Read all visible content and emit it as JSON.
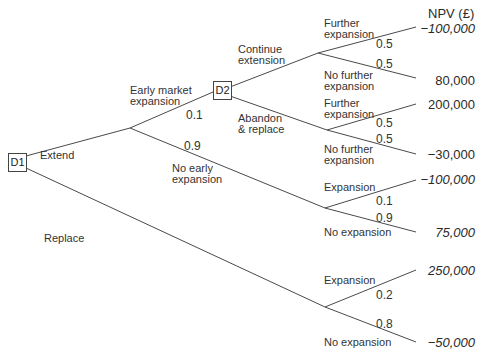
{
  "header": {
    "npv_label": "NPV (£)"
  },
  "nodes": {
    "d1": "D1",
    "d2": "D2"
  },
  "branches": {
    "extend": "Extend",
    "replace": "Replace",
    "early_market_expansion": "Early market\nexpansion",
    "no_early_expansion": "No early\nexpansion",
    "continue_extension": "Continue\nextension",
    "abandon_replace": "Abandon\n& replace",
    "ce_further": "Further\nexpansion",
    "ce_no_further": "No further\nexpansion",
    "ar_further": "Further\nexpansion",
    "ar_no_further": "No further\nexpansion",
    "ne_expansion": "Expansion",
    "ne_no_expansion": "No expansion",
    "rp_expansion": "Expansion",
    "rp_no_expansion": "No expansion"
  },
  "probabilities": {
    "early_market": "0.1",
    "no_early": "0.9",
    "ce_further": "0.5",
    "ce_no_further": "0.5",
    "ar_further": "0.5",
    "ar_no_further": "0.5",
    "ne_expansion": "0.1",
    "ne_no_expansion": "0.9",
    "rp_expansion": "0.2",
    "rp_no_expansion": "0.8"
  },
  "outcomes": [
    {
      "value": "−100,000",
      "italic": true
    },
    {
      "value": "80,000",
      "italic": false
    },
    {
      "value": "200,000",
      "italic": false
    },
    {
      "value": "−30,000",
      "italic": false
    },
    {
      "value": "−100,000",
      "italic": true
    },
    {
      "value": "75,000",
      "italic": true
    },
    {
      "value": "250,000",
      "italic": true
    },
    {
      "value": "−50,000",
      "italic": true
    }
  ],
  "colors": {
    "line": "#4a4a4a",
    "text": "#2a2a2a"
  }
}
